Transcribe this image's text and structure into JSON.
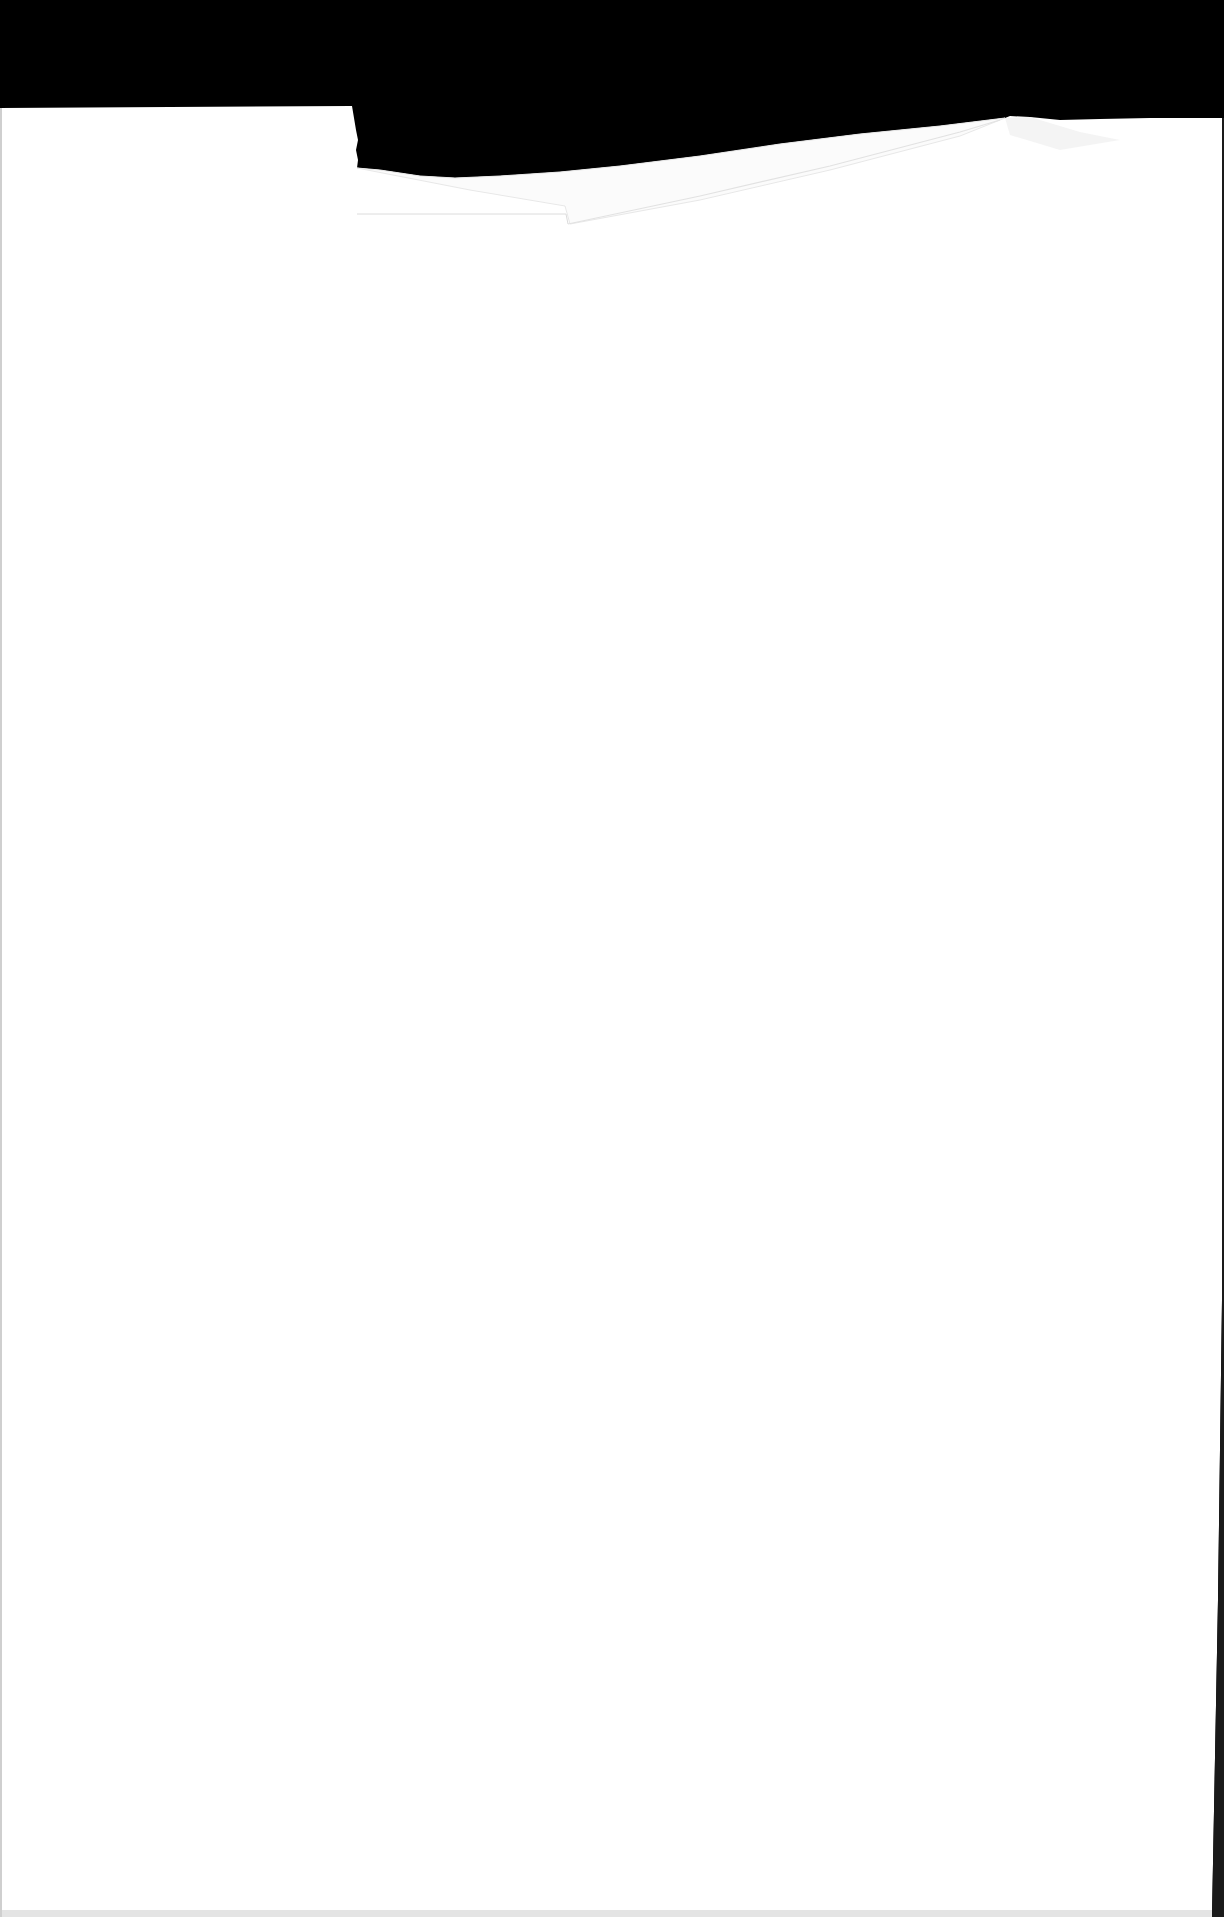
{
  "document": {
    "type": "scanned-page",
    "content": "blank",
    "text_blocks": []
  },
  "colors": {
    "background": "#000000",
    "paper": "#ffffff",
    "fold_shadow": "#e6e6e6",
    "edge_shadow": "#d9d9d9"
  }
}
